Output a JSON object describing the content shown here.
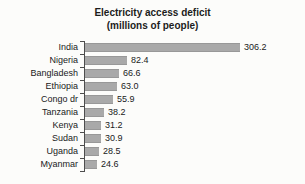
{
  "title": {
    "line1": "Electricity access deficit",
    "line2": "(millions of people)"
  },
  "chart_data": {
    "type": "bar",
    "orientation": "horizontal",
    "title": "Electricity access deficit (millions of people)",
    "categories": [
      "India",
      "Nigeria",
      "Bangladesh",
      "Ethiopia",
      "Congo dr",
      "Tanzania",
      "Kenya",
      "Sudan",
      "Uganda",
      "Myanmar"
    ],
    "values": [
      306.2,
      82.4,
      66.6,
      63.0,
      55.9,
      38.2,
      31.2,
      30.9,
      28.5,
      24.6
    ],
    "value_labels": [
      "306.2",
      "82.4",
      "66.6",
      "63.0",
      "55.9",
      "38.2",
      "31.2",
      "30.9",
      "28.5",
      "24.6"
    ],
    "xlabel": "",
    "ylabel": "",
    "xlim": [
      0,
      320
    ],
    "grid": false,
    "legend": null,
    "bar_color": "#a9a9a9",
    "axis_color": "#4d4d4d",
    "text_color": "#1a1a1a",
    "background_color": "#fcfcfa"
  },
  "layout_hints": {
    "value_labels_outside_bars": true,
    "category_ticks_outward": true
  }
}
